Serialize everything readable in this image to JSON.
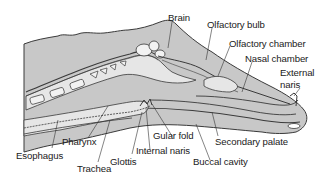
{
  "figure": {
    "colors": {
      "tissue_fill": "#c8c8c8",
      "light_fill": "#e6e6e6",
      "outline": "#3a3a3a",
      "label_text": "#1a1a1a",
      "leader_line": "#333333"
    }
  },
  "labels": {
    "brain": "Brain",
    "olfactory_bulb": "Olfactory bulb",
    "olfactory_chamber": "Olfactory chamber",
    "nasal_chamber": "Nasal chamber",
    "external_naris_1": "External",
    "external_naris_2": "naris",
    "pharynx": "Pharynx",
    "esophagus": "Esophagus",
    "trachea": "Trachea",
    "glottis": "Glottis",
    "internal_naris": "Internal naris",
    "gular_fold": "Gular fold",
    "buccal_cavity": "Buccal cavity",
    "secondary_palate": "Secondary palate"
  }
}
